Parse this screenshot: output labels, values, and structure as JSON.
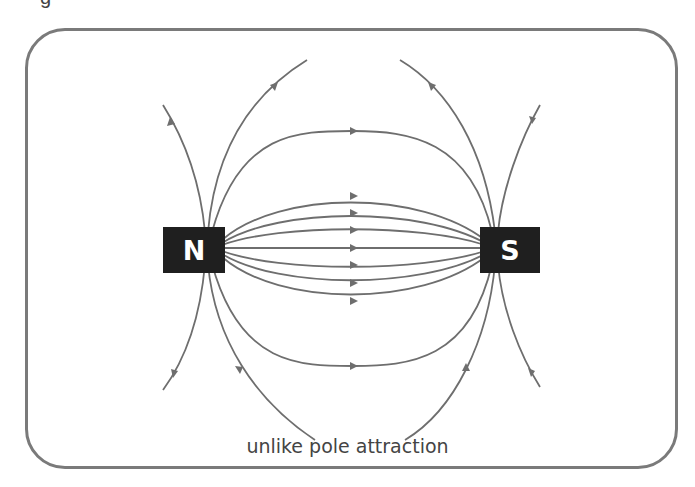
{
  "diagram": {
    "title_fragment": "g",
    "caption": "unlike pole attraction",
    "magnets": [
      {
        "label": "N",
        "pole": "north"
      },
      {
        "label": "S",
        "pole": "south"
      }
    ],
    "field_line_direction": "north-to-south",
    "colors": {
      "field_line": "#6e6e6e",
      "magnet_fill": "#1f1f1f",
      "magnet_text": "#ffffff",
      "frame": "#7a7a7a"
    }
  }
}
